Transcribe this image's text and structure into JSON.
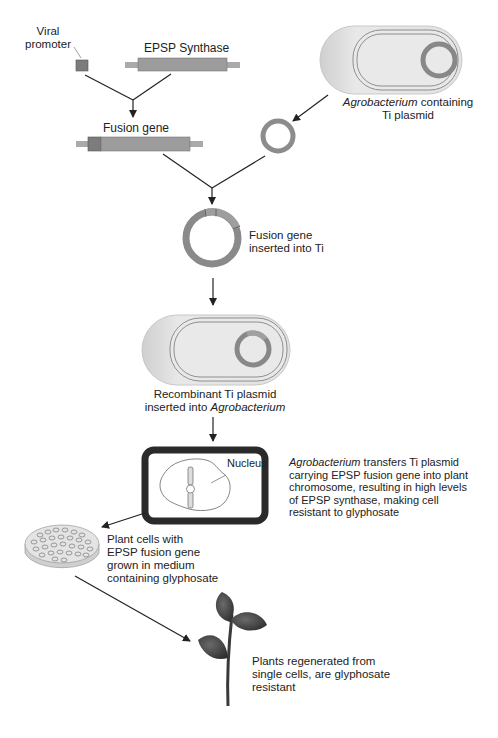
{
  "labels": {
    "viral_promoter": [
      "Viral",
      "promoter"
    ],
    "epsp_synthase": "EPSP Synthase",
    "fusion_gene": "Fusion gene",
    "agro_ti": {
      "italic": "Agrobacterium",
      "rest": " containing",
      "line2": "Ti plasmid"
    },
    "fusion_inserted": [
      "Fusion gene",
      "inserted into Ti"
    ],
    "recombinant": {
      "line1": "Recombinant Ti plasmid",
      "line2_pre": "inserted into ",
      "line2_italic": "Agrobacterium"
    },
    "nucleus": "Nucleus",
    "transfer": {
      "italic": "Agrobacterium",
      "line1_rest": " transfers Ti plasmid",
      "line2": "carrying EPSP fusion gene into plant",
      "line3": "chromosome, resulting in high levels",
      "line4": "of EPSP synthase, making cell",
      "line5": "resistant to glyphosate"
    },
    "plant_cells": [
      "Plant cells with",
      "EPSP fusion gene",
      "grown in medium",
      "containing glyphosate"
    ],
    "plants_regen": [
      "Plants regenerated from",
      "single cells, are glyphosate",
      "resistant"
    ]
  },
  "colors": {
    "gene_body": "#9a9a9a",
    "promoter": "#7a7a7a",
    "plasmid_ring": "#8c8c8c",
    "bacterium_fill": "#e6e6e6",
    "cell_wall": "#2a2a2a",
    "leaf": "#4a4a4a"
  }
}
